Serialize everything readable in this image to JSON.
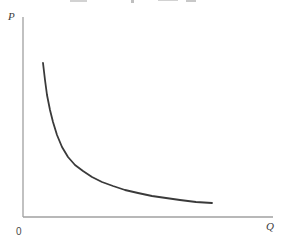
{
  "figure": {
    "kind": "economics-demand-curve-figure",
    "background": "#ffffff"
  },
  "labels": {
    "y_axis": "P",
    "x_axis": "Q",
    "origin": "0"
  },
  "colors": {
    "axis": "#a0a0a0",
    "curve": "#3a3a3a",
    "axis_label": "#3c3c3c",
    "origin_label": "#4a4a4a",
    "background": "#ffffff"
  },
  "chart_data": {
    "type": "line",
    "title": "",
    "xlabel": "Q",
    "ylabel": "P",
    "origin_label": "0",
    "grid": false,
    "legend": false,
    "axis_tick_labels": [],
    "axes_px": {
      "origin": [
        23,
        217
      ],
      "x_axis_end": [
        273,
        217
      ],
      "y_axis_top": [
        23,
        17
      ]
    },
    "series": [
      {
        "name": "demand-curve",
        "shape": "rectangular-hyperbola",
        "stroke_width": 1.8,
        "points_px": [
          [
            43,
            63
          ],
          [
            45,
            80
          ],
          [
            47,
            95
          ],
          [
            50,
            110
          ],
          [
            53,
            122
          ],
          [
            57,
            135
          ],
          [
            62,
            147
          ],
          [
            68,
            157
          ],
          [
            75,
            165
          ],
          [
            83,
            171
          ],
          [
            92,
            177
          ],
          [
            102,
            182
          ],
          [
            113,
            186
          ],
          [
            125,
            190
          ],
          [
            138,
            193
          ],
          [
            152,
            196
          ],
          [
            166,
            198
          ],
          [
            180,
            200
          ],
          [
            196,
            202
          ],
          [
            212,
            203
          ]
        ]
      }
    ]
  }
}
